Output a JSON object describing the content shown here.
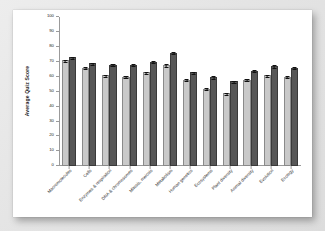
{
  "chart_data": {
    "type": "bar",
    "title": "",
    "subtitle": "",
    "xlabel": "",
    "ylabel": "Average Quiz Score",
    "ylim": [
      0,
      100
    ],
    "yticks": [
      0,
      10,
      20,
      30,
      40,
      50,
      60,
      70,
      80,
      90,
      100
    ],
    "grid": false,
    "legend": "none",
    "orientation": "vertical",
    "categories": [
      "Macromolecules",
      "Cells",
      "Enzymes & respiration",
      "DNA & chromosomes",
      "Mitosis, meiosis",
      "Metabolism",
      "Human genetics",
      "Ecosystems",
      "Plant diversity",
      "Animal diversity",
      "Evolution",
      "Ecology"
    ],
    "series": [
      {
        "name": "Series 1",
        "color": "#c9c9c9",
        "values": [
          71,
          66,
          61,
          60,
          63,
          68,
          58,
          52,
          49,
          58,
          61,
          60
        ],
        "errors": [
          1.0,
          1.0,
          1.0,
          1.0,
          1.0,
          1.2,
          1.0,
          1.0,
          1.0,
          1.0,
          1.0,
          1.0
        ]
      },
      {
        "name": "Series 2",
        "color": "#575757",
        "values": [
          73,
          69,
          68,
          68,
          70,
          76,
          63,
          60,
          57,
          64,
          67,
          66
        ],
        "errors": [
          1.0,
          1.0,
          1.0,
          1.0,
          1.0,
          1.0,
          1.0,
          1.2,
          1.0,
          1.0,
          1.2,
          1.0
        ]
      }
    ]
  }
}
